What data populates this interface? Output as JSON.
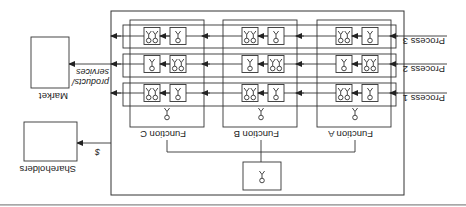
{
  "orientation": "rotated-180",
  "colors": {
    "line": "#333333",
    "background": "#ffffff",
    "rule": "#aaaaaa"
  },
  "diagram": {
    "top_unit": {
      "icon": "person-icon"
    },
    "functions": [
      {
        "label": "Function A"
      },
      {
        "label": "Function B"
      },
      {
        "label": "Function C"
      }
    ],
    "processes": [
      {
        "label": "Process 1",
        "cells": [
          [
            "single",
            "double"
          ],
          [
            "single",
            "double"
          ],
          [
            "single",
            "double"
          ]
        ]
      },
      {
        "label": "Process 2",
        "cells": [
          [
            "double",
            "single"
          ],
          [
            "double",
            "single"
          ],
          [
            "double",
            "single"
          ]
        ]
      },
      {
        "label": "Process 3",
        "cells": [
          [
            "single",
            "double"
          ],
          [
            "single",
            "double"
          ],
          [
            "single",
            "double"
          ]
        ]
      }
    ],
    "outputs": [
      {
        "target": "Shareholders",
        "flow_label": "$"
      },
      {
        "target": "Market",
        "flow_label": "products/ services"
      }
    ]
  }
}
